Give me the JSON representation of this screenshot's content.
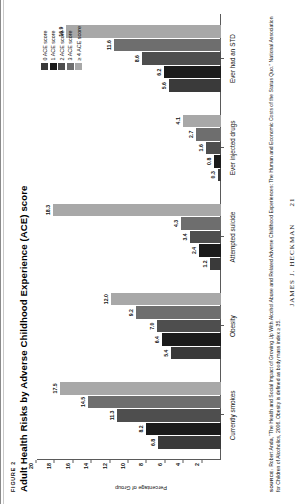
{
  "figure": {
    "label": "FIGURE 2",
    "title": "Adult Health Risks by Adverse Childhood Experience (ACE) score"
  },
  "source": {
    "tag": "SOURCE:",
    "text": " Robert Anda, \"The Health and Social Impact of Growing Up With Alcohol Abuse and Related Adverse Childhood Experiences: The Human and Economic Costs of the Status Quo.\" National Association for Children of Alcoholics, 2006. Obesity is defined as body mass index ≥ 35."
  },
  "footer": {
    "running_head": "JAMES J. HECKMAN",
    "page_number": "21"
  },
  "colors": {
    "ace0": "#3a3a3a",
    "ace1": "#1b1b1b",
    "ace2": "#4e4e4e",
    "ace3": "#6e6e6e",
    "ace4": "#a8a8a8",
    "axis": "#5a5a5a",
    "text": "#111111"
  },
  "chart_data": {
    "type": "bar",
    "title": "Adult Health Risks by Adverse Childhood Experience (ACE) score",
    "xlabel": "",
    "ylabel": "Percentage of Group",
    "ylim": [
      0,
      20
    ],
    "yticks": [
      "2",
      "4",
      "6",
      "8",
      "10",
      "12",
      "14",
      "16",
      "18",
      "20"
    ],
    "grid": false,
    "legend_position": "top-right",
    "categories": [
      "Currently smokes",
      "Obesity",
      "Attempted suicide",
      "Ever injected drugs",
      "Ever had an STD"
    ],
    "series": [
      {
        "name": "0 ACE score",
        "values": [
          6.8,
          5.4,
          1.2,
          0.3,
          5.6
        ],
        "labels": [
          "6.8",
          "5.4",
          "1.2",
          "0.3",
          "5.6"
        ]
      },
      {
        "name": "1 ACE score",
        "values": [
          8.2,
          6.4,
          2.4,
          0.8,
          6.2
        ],
        "labels": [
          "8.2",
          "6.4",
          "2.4",
          "0.8",
          "6.2"
        ]
      },
      {
        "name": "2 ACE score",
        "values": [
          11.3,
          7.0,
          3.4,
          1.6,
          8.6
        ],
        "labels": [
          "11.3",
          "7.0",
          "3.4",
          "1.6",
          "8.6"
        ]
      },
      {
        "name": "3 ACE score",
        "values": [
          14.5,
          9.2,
          4.3,
          2.7,
          11.6
        ],
        "labels": [
          "14.5",
          "9.2",
          "4.3",
          "2.7",
          "11.6"
        ]
      },
      {
        "name": "≥ 4 ACE score",
        "values": [
          17.5,
          12.0,
          18.3,
          4.1,
          16.9
        ],
        "labels": [
          "17.5",
          "12.0",
          "18.3",
          "4.1",
          "16.9"
        ]
      }
    ]
  }
}
